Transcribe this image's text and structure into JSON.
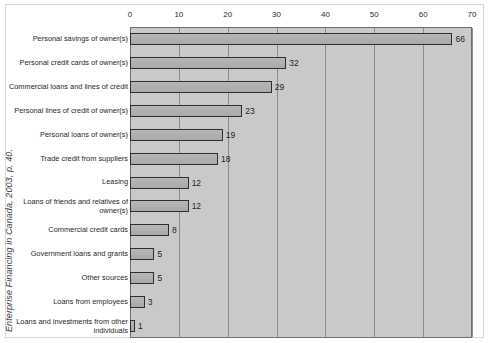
{
  "source_credit": "Enterprise Financing in Canada, 2003, p. 40.",
  "chart_data": {
    "type": "bar",
    "orientation": "horizontal",
    "title": "",
    "subtitle": "",
    "xlabel": "",
    "ylabel": "",
    "xlim": [
      0,
      70
    ],
    "xticks": [
      0,
      10,
      20,
      30,
      40,
      50,
      60,
      70
    ],
    "tick_labels": [
      "0",
      "10",
      "20",
      "30",
      "40",
      "50",
      "60",
      "70"
    ],
    "grid": true,
    "grid_axis": "x",
    "legend": false,
    "axis_position": "top",
    "categories": [
      "Personal savings of owner(s)",
      "Personal credit cards of owner(s)",
      "Commercial loans and lines of credit",
      "Personal lines of credit of owner(s)",
      "Personal loans of owner(s)",
      "Trade credit from suppliers",
      "Leasing",
      "Loans of friends and relatives of owner(s)",
      "Commercial credit cards",
      "Government loans and grants",
      "Other sources",
      "Loans from employees",
      "Loans and investments from other individuals"
    ],
    "values": [
      66,
      32,
      29,
      23,
      19,
      18,
      12,
      12,
      8,
      5,
      5,
      3,
      1
    ],
    "data_labels": [
      "66",
      "32",
      "29",
      "23",
      "19",
      "18",
      "12",
      "12",
      "8",
      "5",
      "5",
      "3",
      "1"
    ],
    "colors": {
      "plot_background": "#c9c9c9",
      "bar_fill": "#b0b0b0",
      "bar_border": "#2f2f2f",
      "gridline": "#8c8c8c",
      "page_background": "#ffffff",
      "text": "#1f1f1f"
    }
  }
}
